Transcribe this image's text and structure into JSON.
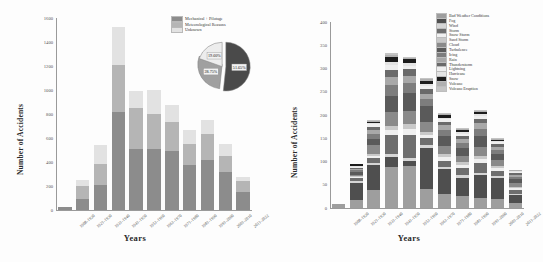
{
  "figures": {
    "left": {
      "name": "accidents-by-cause",
      "ylabel": "Number of Accidents",
      "xlabel": "Years"
    },
    "right": {
      "name": "accidents-by-weather",
      "ylabel": "Number of Accidents",
      "xlabel": "Years"
    }
  },
  "chart_data": [
    {
      "type": "bar",
      "title": "",
      "xlabel": "Years",
      "ylabel": "Number of Accidents",
      "stacked": true,
      "grid": false,
      "legend_position": "top-right",
      "ylim": [
        0,
        1600
      ],
      "yticks": [
        0,
        200,
        400,
        600,
        800,
        1000,
        1200,
        1400,
        1600
      ],
      "categories": [
        "1908-1920",
        "1921-1930",
        "1931-1940",
        "1941-1950",
        "1951-1960",
        "1961-1970",
        "1971-1980",
        "1981-1990",
        "1991-2000",
        "2001-2010",
        "2011-2022"
      ],
      "series": [
        {
          "name": "Mechanical + Pilotage",
          "color": "#8c8c8c",
          "values": [
            22,
            95,
            212,
            820,
            512,
            508,
            488,
            375,
            418,
            318,
            150
          ]
        },
        {
          "name": "Meteorological Reasons",
          "color": "#b5b5b5",
          "values": [
            3,
            105,
            175,
            385,
            338,
            295,
            243,
            178,
            212,
            132,
            88
          ]
        },
        {
          "name": "Unknown",
          "color": "#e2e2e2",
          "values": [
            2,
            48,
            158,
            320,
            142,
            200,
            148,
            115,
            118,
            98,
            38
          ]
        }
      ]
    },
    {
      "type": "pie",
      "title": "",
      "inset_of": "accidents-by-cause",
      "labels": [
        "Mechanical + Pilotage",
        "Meteorological Reasons",
        "Unknown"
      ],
      "values": [
        51.65,
        28.75,
        19.6
      ],
      "display_labels": [
        "51.65%",
        "28.75%",
        "19.60%"
      ],
      "colors": [
        "#4a4a4a",
        "#a0a0a0",
        "#ededed"
      ],
      "exploded": true
    },
    {
      "type": "bar",
      "title": "",
      "xlabel": "Years",
      "ylabel": "Number of Accidents",
      "stacked": true,
      "grid": false,
      "legend_position": "top-right",
      "ylim": [
        0,
        400
      ],
      "yticks": [
        0,
        50,
        100,
        150,
        200,
        250,
        300,
        350,
        400
      ],
      "categories": [
        "1908-1920",
        "1921-1930",
        "1931-1940",
        "1941-1950",
        "1951-1960",
        "1961-1970",
        "1971-1980",
        "1981-1990",
        "1991-2000",
        "2001-2010",
        "2011-2022"
      ],
      "series": [
        {
          "name": "Bad Weather Conditions",
          "color": "#9e9e9e",
          "values": [
            9,
            18,
            38,
            88,
            90,
            40,
            30,
            26,
            22,
            20,
            10
          ]
        },
        {
          "name": "Fog",
          "color": "#4f4f4f",
          "values": [
            0,
            36,
            55,
            22,
            12,
            90,
            54,
            38,
            48,
            44,
            18
          ]
        },
        {
          "name": "Wind",
          "color": "#d6d6d6",
          "values": [
            0,
            4,
            4,
            6,
            6,
            6,
            4,
            6,
            5,
            4,
            3
          ]
        },
        {
          "name": "Storm",
          "color": "#6e6e6e",
          "values": [
            0,
            6,
            10,
            42,
            50,
            14,
            14,
            16,
            22,
            12,
            8
          ]
        },
        {
          "name": "Snow Storm",
          "color": "#f0f0f0",
          "values": [
            0,
            2,
            6,
            10,
            12,
            8,
            8,
            6,
            8,
            6,
            4
          ]
        },
        {
          "name": "Sand Storm",
          "color": "#c9c9c9",
          "values": [
            0,
            2,
            4,
            8,
            10,
            6,
            6,
            6,
            7,
            5,
            3
          ]
        },
        {
          "name": "Cloud",
          "color": "#8a8a8a",
          "values": [
            0,
            4,
            18,
            30,
            28,
            22,
            18,
            14,
            20,
            12,
            8
          ]
        },
        {
          "name": "Turbulence",
          "color": "#5a5a5a",
          "values": [
            0,
            6,
            14,
            36,
            40,
            34,
            22,
            18,
            24,
            14,
            8
          ]
        },
        {
          "name": "Icing",
          "color": "#7d7d7d",
          "values": [
            0,
            3,
            10,
            22,
            20,
            14,
            12,
            10,
            14,
            8,
            5
          ]
        },
        {
          "name": "Rain",
          "color": "#a8a8a8",
          "values": [
            0,
            3,
            8,
            18,
            16,
            12,
            10,
            8,
            12,
            7,
            4
          ]
        },
        {
          "name": "Thunderstorm",
          "color": "#6a6a6a",
          "values": [
            0,
            3,
            8,
            16,
            14,
            10,
            8,
            8,
            10,
            6,
            4
          ]
        },
        {
          "name": "Lightning",
          "color": "#efefef",
          "values": [
            0,
            2,
            5,
            10,
            8,
            6,
            5,
            4,
            6,
            4,
            2
          ]
        },
        {
          "name": "Hurricane",
          "color": "#e4e4e4",
          "values": [
            0,
            1,
            3,
            6,
            5,
            4,
            3,
            3,
            4,
            2,
            2
          ]
        },
        {
          "name": "Snow",
          "color": "#1c1c1c",
          "values": [
            0,
            5,
            3,
            12,
            9,
            8,
            7,
            6,
            4,
            2,
            1
          ]
        },
        {
          "name": "Volcano",
          "color": "#b0b0b0",
          "values": [
            0,
            0,
            2,
            4,
            3,
            3,
            2,
            2,
            3,
            2,
            1
          ]
        },
        {
          "name": "Volcano Eruption",
          "color": "#c4c4c4",
          "values": [
            0,
            0,
            2,
            3,
            3,
            2,
            2,
            2,
            2,
            2,
            1
          ]
        }
      ]
    }
  ]
}
